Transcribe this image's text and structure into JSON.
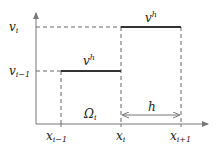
{
  "diagram": {
    "type": "piecewise-constant-function",
    "y_labels": {
      "upper": {
        "base": "v",
        "sub": "i"
      },
      "lower": {
        "base": "v",
        "sub": "i−1"
      }
    },
    "x_labels": [
      {
        "base": "x",
        "sub": "i−1"
      },
      {
        "base": "x",
        "sub": "i"
      },
      {
        "base": "x",
        "sub": "i+1"
      }
    ],
    "step_labels": [
      {
        "base": "v",
        "sup": "h"
      },
      {
        "base": "v",
        "sup": "h"
      }
    ],
    "region_label": {
      "base": "Ω",
      "sub": "i"
    },
    "width_label": "h",
    "colors": {
      "axis": "#777777",
      "step": "#333333",
      "dashed": "#666666"
    }
  }
}
